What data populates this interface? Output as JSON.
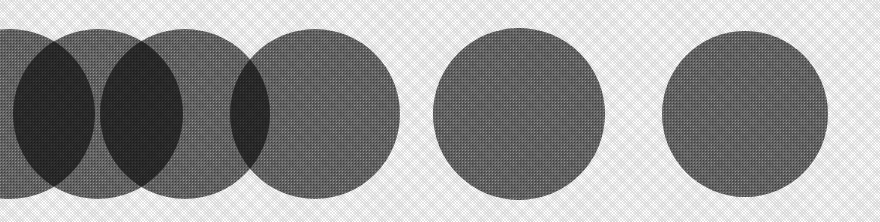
{
  "figure": {
    "caption": "",
    "background_color": "#ffffff",
    "width": 880,
    "height": 222
  },
  "chart_data": {
    "type": "scatter",
    "title": "",
    "subtitle": "",
    "xlabel": "",
    "ylabel": "",
    "grid": false,
    "legend": null,
    "annotations": [],
    "xlim": [
      0,
      880
    ],
    "ylim": [
      0,
      222
    ],
    "description": "Row of six equal-radius filled circles on a white ground; the four leftmost circles overlap progressively less, producing dark lens-shaped intersections, while the two rightmost circles stand apart with clear white gaps.",
    "shape": "circle",
    "radius": 85,
    "center_y": 114,
    "fill_color": "#6a6a6a",
    "overlap_color": "#2a2a2a",
    "categories": [
      "circle-1",
      "circle-2",
      "circle-3",
      "circle-4",
      "circle-5",
      "circle-6"
    ],
    "x": [
      10,
      98,
      185,
      315,
      519,
      745
    ],
    "y": [
      114,
      114,
      114,
      114,
      114,
      114
    ],
    "series": [
      {
        "name": "center-x",
        "values": [
          10,
          98,
          185,
          315,
          519,
          745
        ]
      },
      {
        "name": "center-y",
        "values": [
          114,
          114,
          114,
          114,
          114,
          114
        ]
      },
      {
        "name": "radius",
        "values": [
          85,
          85,
          85,
          85,
          85,
          85
        ]
      }
    ],
    "gaps": [
      {
        "pair": "circle-1 / circle-2",
        "center_distance": 88,
        "overlap": true
      },
      {
        "pair": "circle-2 / circle-3",
        "center_distance": 87,
        "overlap": true
      },
      {
        "pair": "circle-3 / circle-4",
        "center_distance": 130,
        "overlap": true
      },
      {
        "pair": "circle-4 / circle-5",
        "center_distance": 204,
        "overlap": false
      },
      {
        "pair": "circle-5 / circle-6",
        "center_distance": 226,
        "overlap": false
      }
    ]
  },
  "circles": [
    {
      "name": "circle-1",
      "cx": 10,
      "cy": 114,
      "r": 85,
      "clipped_at_left_edge": true
    },
    {
      "name": "circle-2",
      "cx": 98,
      "cy": 114,
      "r": 85,
      "clipped_at_left_edge": false
    },
    {
      "name": "circle-3",
      "cx": 185,
      "cy": 114,
      "r": 85,
      "clipped_at_left_edge": false
    },
    {
      "name": "circle-4",
      "cx": 315,
      "cy": 114,
      "r": 85,
      "clipped_at_left_edge": false
    },
    {
      "name": "circle-5",
      "cx": 519,
      "cy": 114,
      "r": 86,
      "clipped_at_left_edge": false
    },
    {
      "name": "circle-6",
      "cx": 745,
      "cy": 114,
      "r": 83,
      "clipped_at_left_edge": false
    }
  ],
  "colors": {
    "background": "#ffffff",
    "circle_fill": "#6a6a6a",
    "circle_overlap": "#2a2a2a"
  }
}
